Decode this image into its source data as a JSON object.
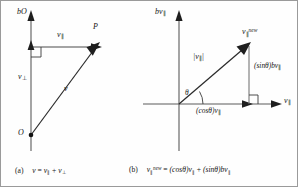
{
  "figure": {
    "panels": [
      {
        "id": "a",
        "caption_prefix": "(a)",
        "caption_lhs": "v",
        "caption_eq": "=",
        "caption_term1_base": "v",
        "caption_term1_sub": "∥",
        "caption_plus": "+",
        "caption_term2_base": "v",
        "caption_term2_sub": "⊥",
        "axis_label_vertical": "bO",
        "label_v_parallel_base": "v",
        "label_v_parallel_sub": "∥",
        "label_v_perp_base": "v",
        "label_v_perp_sub": "⊥",
        "label_point_P": "P",
        "label_origin_O": "O",
        "label_vector_v": "v"
      },
      {
        "id": "b",
        "caption_prefix": "(b)",
        "caption_lhs_base": "v",
        "caption_lhs_sub": "∥",
        "caption_lhs_sup": "new",
        "caption_eq": "=",
        "caption_term1": "(cosθ)v",
        "caption_term1_sub": "∥",
        "caption_plus": "+",
        "caption_term2": "(sinθ)bv",
        "caption_term2_sub": "∥",
        "axis_label_vertical_base": "bv",
        "axis_label_vertical_sub": "∥",
        "axis_label_horizontal_base": "v",
        "axis_label_horizontal_sub": "∥",
        "label_magnitude": "|v",
        "label_magnitude_sub": "∥",
        "label_magnitude_close": "|",
        "label_result_base": "v",
        "label_result_sub": "∥",
        "label_result_sup": "new",
        "label_theta": "θ",
        "label_cos_component": "(cosθ)v",
        "label_cos_component_sub": "∥",
        "label_sin_component": "(sinθ)bv",
        "label_sin_component_sub": "∥"
      }
    ]
  },
  "style": {
    "line_color": "#4f4f4f",
    "vector_color": "#1e1e1e",
    "text_color": "#161616",
    "border_color": "#9a9a9a",
    "background": "#fefefe"
  }
}
